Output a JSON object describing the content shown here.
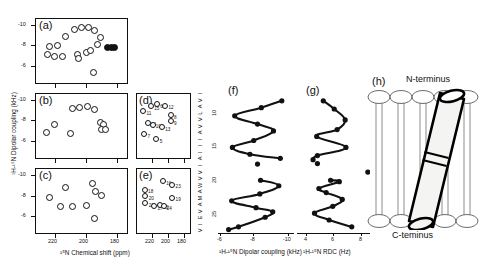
{
  "figure": {
    "type": "solid-state-nmr-multipanel",
    "panels": [
      "(a)",
      "(b)",
      "(c)",
      "(d)",
      "(e)",
      "(f)",
      "(g)",
      "(h)"
    ]
  },
  "axes": {
    "y_label_left": "¹H-¹⁵N Dipolar coupling (kHz)",
    "x_label_left": "¹⁵N Chemical shift (ppm)",
    "x_label_f": "¹H-¹⁵N Dipolar coupling (kHz)",
    "x_label_g": "¹H-¹⁵N RDC (Hz)",
    "y_ticks_left": [
      "-10",
      "-8",
      "-6"
    ],
    "y_ticks_c": [
      "-10",
      "-8",
      "-6"
    ],
    "x_ticks_ac": [
      "220",
      "200",
      "180"
    ],
    "x_ticks_de": [
      "220",
      "200",
      "180"
    ],
    "x_ticks_f": [
      "-6",
      "-8",
      "-10"
    ],
    "x_ticks_g": [
      "4",
      "6",
      "8"
    ],
    "residue_ticks": [
      "10",
      "15",
      "20",
      "25"
    ]
  },
  "sequence": {
    "letters": [
      "I",
      "V",
      "A",
      "L",
      "V",
      "V",
      "A",
      "I",
      "I",
      "I",
      "A",
      "I",
      "V",
      "V",
      "W",
      "A",
      "M",
      "A",
      "V",
      "E",
      "I",
      "V"
    ],
    "text": "IVALVVAIIIAIVVWAMAVEIV"
  },
  "panel_a": {
    "label": "(a)",
    "points": [
      {
        "x": 0.42,
        "y": 0.17
      },
      {
        "x": 0.5,
        "y": 0.14
      },
      {
        "x": 0.57,
        "y": 0.15
      },
      {
        "x": 0.64,
        "y": 0.19
      },
      {
        "x": 0.33,
        "y": 0.28
      },
      {
        "x": 0.7,
        "y": 0.3
      },
      {
        "x": 0.16,
        "y": 0.43
      },
      {
        "x": 0.24,
        "y": 0.42
      },
      {
        "x": 0.67,
        "y": 0.4
      },
      {
        "x": 0.78,
        "y": 0.44,
        "filled": true
      },
      {
        "x": 0.82,
        "y": 0.44,
        "filled": true
      },
      {
        "x": 0.86,
        "y": 0.44,
        "filled": true
      },
      {
        "x": 0.13,
        "y": 0.55
      },
      {
        "x": 0.21,
        "y": 0.58
      },
      {
        "x": 0.3,
        "y": 0.59
      },
      {
        "x": 0.46,
        "y": 0.56
      },
      {
        "x": 0.55,
        "y": 0.52
      },
      {
        "x": 0.6,
        "y": 0.49
      },
      {
        "x": 0.47,
        "y": 0.62
      },
      {
        "x": 0.63,
        "y": 0.82
      }
    ]
  },
  "panel_b": {
    "label": "(b)",
    "points": [
      {
        "x": 0.4,
        "y": 0.23
      },
      {
        "x": 0.48,
        "y": 0.22
      },
      {
        "x": 0.56,
        "y": 0.21
      },
      {
        "x": 0.64,
        "y": 0.25
      },
      {
        "x": 0.21,
        "y": 0.47
      },
      {
        "x": 0.7,
        "y": 0.45
      },
      {
        "x": 0.74,
        "y": 0.48
      },
      {
        "x": 0.12,
        "y": 0.6
      },
      {
        "x": 0.71,
        "y": 0.55
      },
      {
        "x": 0.76,
        "y": 0.55
      },
      {
        "x": 0.38,
        "y": 0.62
      }
    ]
  },
  "panel_c": {
    "label": "(c)",
    "points": [
      {
        "x": 0.62,
        "y": 0.24
      },
      {
        "x": 0.33,
        "y": 0.3
      },
      {
        "x": 0.65,
        "y": 0.36
      },
      {
        "x": 0.72,
        "y": 0.42
      },
      {
        "x": 0.16,
        "y": 0.44
      },
      {
        "x": 0.27,
        "y": 0.58
      },
      {
        "x": 0.4,
        "y": 0.58
      },
      {
        "x": 0.55,
        "y": 0.57
      },
      {
        "x": 0.64,
        "y": 0.76
      }
    ]
  },
  "panel_d": {
    "label": "(d)",
    "points": [
      {
        "x": 0.27,
        "y": 0.2,
        "n": "15"
      },
      {
        "x": 0.38,
        "y": 0.17,
        "n": "6"
      },
      {
        "x": 0.53,
        "y": 0.19,
        "n": "12"
      },
      {
        "x": 0.13,
        "y": 0.28,
        "n": "11"
      },
      {
        "x": 0.63,
        "y": 0.34,
        "n": "8"
      },
      {
        "x": 0.63,
        "y": 0.43,
        "n": "9"
      },
      {
        "x": 0.21,
        "y": 0.45,
        "n": "14"
      },
      {
        "x": 0.3,
        "y": 0.48,
        "n": "10"
      },
      {
        "x": 0.47,
        "y": 0.52,
        "n": "13"
      },
      {
        "x": 0.15,
        "y": 0.62,
        "n": "7"
      },
      {
        "x": 0.37,
        "y": 0.7,
        "n": "5"
      }
    ]
  },
  "panel_e": {
    "label": "(e)",
    "points": [
      {
        "x": 0.49,
        "y": 0.2,
        "n": "16"
      },
      {
        "x": 0.66,
        "y": 0.25,
        "n": "23"
      },
      {
        "x": 0.16,
        "y": 0.33,
        "n": "18"
      },
      {
        "x": 0.17,
        "y": 0.43,
        "n": "20"
      },
      {
        "x": 0.17,
        "y": 0.53,
        "n": "21"
      },
      {
        "x": 0.66,
        "y": 0.45,
        "n": "19"
      },
      {
        "x": 0.33,
        "y": 0.58,
        "n": "17"
      },
      {
        "x": 0.44,
        "y": 0.56,
        "n": "22"
      },
      {
        "x": 0.5,
        "y": 0.58,
        "n": "24"
      }
    ]
  },
  "panel_f": {
    "label": "(f)",
    "wave_points": [
      {
        "x": 0.84,
        "y": 0.035
      },
      {
        "x": 0.57,
        "y": 0.085
      },
      {
        "x": 0.22,
        "y": 0.145
      },
      {
        "x": 0.52,
        "y": 0.205
      },
      {
        "x": 0.73,
        "y": 0.255
      },
      {
        "x": 0.47,
        "y": 0.325
      },
      {
        "x": 0.19,
        "y": 0.375
      },
      {
        "x": 0.42,
        "y": 0.425
      },
      {
        "x": 0.82,
        "y": 0.455
      }
    ],
    "isolated_points": [
      {
        "x": 0.52,
        "y": 0.497
      },
      {
        "x": -0.07,
        "y": 0.565
      }
    ],
    "wave_points2": [
      {
        "x": 0.56,
        "y": 0.615
      },
      {
        "x": 0.8,
        "y": 0.655
      },
      {
        "x": 0.55,
        "y": 0.715
      },
      {
        "x": 0.18,
        "y": 0.765
      },
      {
        "x": 0.5,
        "y": 0.815
      },
      {
        "x": 0.72,
        "y": 0.845
      },
      {
        "x": 0.62,
        "y": 0.885
      },
      {
        "x": 0.27,
        "y": 0.955
      },
      {
        "x": 0.14,
        "y": 0.975
      }
    ]
  },
  "panel_g": {
    "label": "(g)",
    "wave_points": [
      {
        "x": 0.36,
        "y": 0.035
      },
      {
        "x": 0.51,
        "y": 0.095
      },
      {
        "x": 0.66,
        "y": 0.175
      },
      {
        "x": 0.55,
        "y": 0.245
      },
      {
        "x": 0.27,
        "y": 0.295
      },
      {
        "x": 0.67,
        "y": 0.375
      },
      {
        "x": 0.28,
        "y": 0.435
      },
      {
        "x": 0.22,
        "y": 0.465
      }
    ],
    "isolated_points": [
      {
        "x": 0.28,
        "y": 0.493
      },
      {
        "x": 0.97,
        "y": 0.555
      }
    ],
    "wave_points2": [
      {
        "x": 0.46,
        "y": 0.615
      },
      {
        "x": 0.58,
        "y": 0.625
      },
      {
        "x": 0.3,
        "y": 0.675
      },
      {
        "x": 0.4,
        "y": 0.705
      },
      {
        "x": 0.62,
        "y": 0.755
      },
      {
        "x": 0.49,
        "y": 0.805
      },
      {
        "x": 0.24,
        "y": 0.855
      },
      {
        "x": 0.44,
        "y": 0.905
      },
      {
        "x": 0.75,
        "y": 0.955
      }
    ]
  },
  "panel_h": {
    "label": "(h)",
    "n_terminus": "N-terminus",
    "c_terminus": "C-teminus"
  },
  "colors": {
    "ink": "#111111",
    "paper": "#ffffff",
    "helix_fill": "#f2f2f0"
  }
}
